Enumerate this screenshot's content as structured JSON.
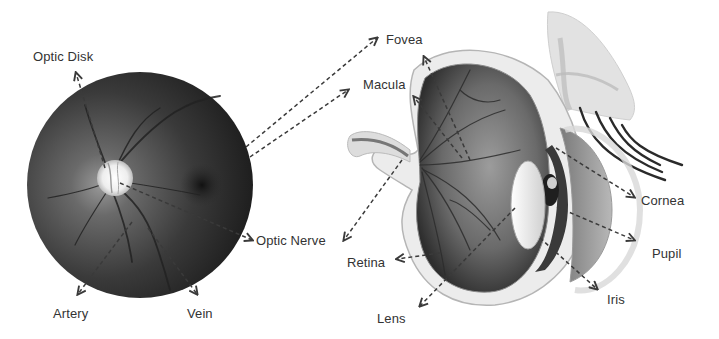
{
  "figure": {
    "colors": {
      "label_text": "#333333",
      "arrow": "#3a3a3a",
      "fundus_outer": "#1a1a1a",
      "fundus_mid": "#4a4a4a",
      "optic_disk": "#f4f4f4",
      "background": "#ffffff"
    },
    "fundus": {
      "name": "Fundus photograph",
      "labels": [
        {
          "key": "optic_disk",
          "text": "Optic Disk",
          "x": 33,
          "y": 50
        },
        {
          "key": "artery",
          "text": "Artery",
          "x": 53,
          "y": 307
        },
        {
          "key": "vein",
          "text": "Vein",
          "x": 187,
          "y": 307
        },
        {
          "key": "optic_nerve",
          "text": "Optic Nerve",
          "x": 256,
          "y": 234
        }
      ]
    },
    "eye": {
      "name": "Eye cross-section",
      "labels": [
        {
          "key": "fovea",
          "text": "Fovea",
          "x": 386,
          "y": 33
        },
        {
          "key": "macula",
          "text": "Macula",
          "x": 363,
          "y": 78
        },
        {
          "key": "retina",
          "text": "Retina",
          "x": 347,
          "y": 256
        },
        {
          "key": "lens",
          "text": "Lens",
          "x": 377,
          "y": 312
        },
        {
          "key": "cornea",
          "text": "Cornea",
          "x": 641,
          "y": 194
        },
        {
          "key": "pupil",
          "text": "Pupil",
          "x": 652,
          "y": 247
        },
        {
          "key": "iris",
          "text": "Iris",
          "x": 607,
          "y": 293
        }
      ]
    }
  }
}
